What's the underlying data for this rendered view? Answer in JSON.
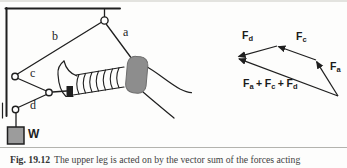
{
  "figure": {
    "caption": {
      "label": "Fig. 19.12",
      "text": "The upper leg is acted on by the vector sum of the forces acting"
    },
    "apparatus": {
      "rope_a": "a",
      "rope_b": "b",
      "rope_c": "c",
      "rope_d": "d",
      "weight_label": "W"
    },
    "vector_diagram": {
      "fd": {
        "base": "F",
        "sub": "d"
      },
      "fc": {
        "base": "F",
        "sub": "c"
      },
      "fa": {
        "base": "F",
        "sub": "a"
      },
      "sum": {
        "f1": "F",
        "s1": "a",
        "op1": "+",
        "f2": "F",
        "s2": "c",
        "op2": "+",
        "f3": "F",
        "s3": "d"
      }
    },
    "colors": {
      "line": "#1f1f1f",
      "cuff_fill": "#8d8d8d",
      "cuff_edge": "#6e6e6e",
      "weight_fill": "#9c9c9c",
      "separator": "#b3b3ae",
      "caption_text": "#3f3f3f"
    }
  }
}
